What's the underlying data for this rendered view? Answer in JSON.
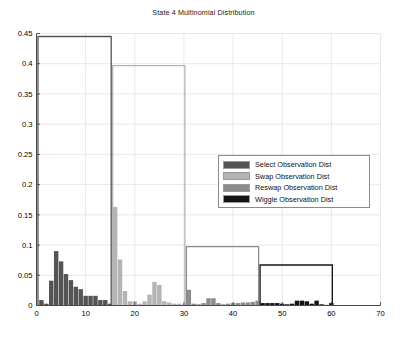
{
  "chart_data": {
    "type": "bar",
    "title": "State 4 Multinomial Distribution",
    "xlabel": "",
    "ylabel": "",
    "xlim": [
      0,
      70
    ],
    "ylim": [
      0,
      0.45
    ],
    "xticks": [
      0,
      10,
      20,
      30,
      40,
      50,
      60,
      70
    ],
    "yticks": [
      0,
      0.05,
      0.1,
      0.15,
      0.2,
      0.25,
      0.3,
      0.35,
      0.4,
      0.45
    ],
    "xtick_labels": [
      "0",
      "10",
      "20",
      "30",
      "40",
      "50",
      "60",
      "70"
    ],
    "ytick_labels": [
      "0",
      "0.05",
      "0.1",
      "0.15",
      "0.2",
      "0.25",
      "0.3",
      "0.35",
      "0.4",
      "0.45"
    ],
    "grid": true,
    "legend_position": "center-right",
    "legend": [
      {
        "label": "Select Observation Dist",
        "color": "#545454"
      },
      {
        "label": "Swap Observation Dist",
        "color": "#b4b4b4"
      },
      {
        "label": "Reswap Observation Dist",
        "color": "#8c8c8c"
      },
      {
        "label": "Wiggle Observation Dist",
        "color": "#141414"
      }
    ],
    "series": [
      {
        "name": "Select Observation Dist",
        "color": "#545454",
        "x": [
          1,
          2,
          3,
          4,
          5,
          6,
          7,
          8,
          9,
          10,
          11,
          12,
          13,
          14,
          15
        ],
        "values": [
          0.009,
          0.003,
          0.041,
          0.09,
          0.073,
          0.052,
          0.042,
          0.031,
          0.027,
          0.016,
          0.016,
          0.016,
          0.009,
          0.009,
          0.003
        ],
        "step_box": {
          "x_start": 0.3,
          "x_end": 15.2,
          "height": 0.445
        }
      },
      {
        "name": "Swap Observation Dist",
        "color": "#b4b4b4",
        "x": [
          16,
          17,
          18,
          19,
          20,
          21,
          22,
          23,
          24,
          25,
          26,
          27,
          28,
          29,
          30
        ],
        "values": [
          0.163,
          0.076,
          0.024,
          0.007,
          0.007,
          0.003,
          0.007,
          0.018,
          0.039,
          0.034,
          0.007,
          0.005,
          0.003,
          0.003,
          0.002
        ],
        "step_box": {
          "x_start": 15.5,
          "x_end": 30.2,
          "height": 0.397
        }
      },
      {
        "name": "Reswap Observation Dist",
        "color": "#8c8c8c",
        "x": [
          31,
          32,
          33,
          34,
          35,
          36,
          37,
          38,
          39,
          40,
          41,
          42,
          43,
          44,
          45
        ],
        "values": [
          0.026,
          0.003,
          0.002,
          0.004,
          0.012,
          0.012,
          0.004,
          0.002,
          0.003,
          0.004,
          0.004,
          0.005,
          0.005,
          0.006,
          0.008
        ],
        "step_box": {
          "x_start": 30.5,
          "x_end": 45.2,
          "height": 0.0975
        }
      },
      {
        "name": "Wiggle Observation Dist",
        "color": "#141414",
        "x": [
          46,
          47,
          48,
          49,
          50,
          51,
          52,
          53,
          54,
          55,
          56,
          57,
          58,
          59,
          60
        ],
        "values": [
          0.004,
          0.004,
          0.004,
          0.004,
          0.003,
          0.002,
          0.003,
          0.008,
          0.008,
          0.007,
          0.003,
          0.008,
          0.002,
          0.001,
          0.004
        ],
        "step_box": {
          "x_start": 45.5,
          "x_end": 60.2,
          "height": 0.067
        }
      }
    ]
  },
  "axes": {
    "title": "State 4 Multinomial Distribution"
  }
}
